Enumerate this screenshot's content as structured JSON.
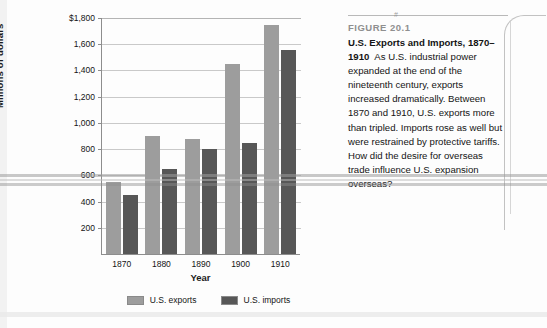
{
  "figure": {
    "number": "FIGURE 20.1",
    "title": "U.S. Exports and Imports, 1870–1910",
    "body": "As U.S. industrial power expanded at the end of the nineteenth century, exports increased dramatically. Between 1870 and 1910, U.S. exports more than tripled. Imports rose as well but were restrained by protective tariffs. How did the desire for overseas trade influence U.S. expansion overseas?",
    "mark": "#"
  },
  "colors": {
    "exports": "#9d9d9d",
    "imports": "#575757",
    "gridline": "#c9c9c9",
    "axis": "#8d8d8d",
    "figure_number": "#8f8f8f"
  },
  "chart_data": {
    "type": "bar",
    "title": "U.S. Exports and Imports, 1870–1910",
    "xlabel": "Year",
    "ylabel": "Millions of dollars",
    "categories": [
      "1870",
      "1880",
      "1890",
      "1900",
      "1910"
    ],
    "series": [
      {
        "name": "U.S. exports",
        "values": [
          550,
          900,
          875,
          1450,
          1745
        ]
      },
      {
        "name": "U.S. imports",
        "values": [
          450,
          645,
          800,
          845,
          1555
        ]
      }
    ],
    "ylim": [
      0,
      1800
    ],
    "yticks": [
      200,
      400,
      600,
      800,
      1000,
      1200,
      1400,
      1600,
      1800
    ],
    "ytick_labels": [
      "200",
      "400",
      "600",
      "800",
      "1,000",
      "1,200",
      "1,400",
      "1,600",
      "$1,800"
    ],
    "grid": true,
    "legend": [
      "U.S. exports",
      "U.S. imports"
    ],
    "legend_position": "bottom"
  }
}
